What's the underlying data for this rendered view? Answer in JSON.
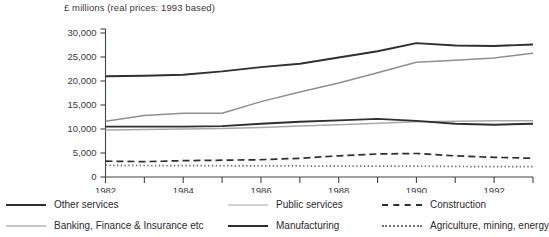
{
  "chart_data": {
    "type": "line",
    "title": "£ millions (real prices: 1993 based)",
    "xlabel": "",
    "ylabel": "",
    "grid": false,
    "legend_position": "bottom",
    "x": [
      1982,
      1983,
      1984,
      1985,
      1986,
      1987,
      1988,
      1989,
      1990,
      1991,
      1992,
      1993
    ],
    "xlim": [
      1982,
      1993
    ],
    "ylim": [
      0,
      30000
    ],
    "ytick_labels": [
      "0",
      "5,000",
      "10,000",
      "15,000",
      "20,000",
      "25,000",
      "30,000"
    ],
    "yticks": [
      0,
      5000,
      10000,
      15000,
      20000,
      25000,
      30000
    ],
    "xtick_labels": [
      "1982",
      "1984",
      "1986",
      "1988",
      "1990",
      "1992"
    ],
    "xticks_labeled": [
      1982,
      1984,
      1986,
      1988,
      1990,
      1992
    ],
    "xticks_all": [
      1982,
      1983,
      1984,
      1985,
      1986,
      1987,
      1988,
      1989,
      1990,
      1991,
      1992,
      1993
    ],
    "series": [
      {
        "name": "Other services",
        "style": "solid-dark",
        "color": "#2f2f2f",
        "values": [
          21000,
          21100,
          21300,
          22000,
          22900,
          23600,
          24900,
          26200,
          27900,
          27400,
          27300,
          27600
        ]
      },
      {
        "name": "Banking, Finance & Insurance etc",
        "style": "solid-mid",
        "color": "#8f8f8f",
        "values": [
          11600,
          12800,
          13300,
          13300,
          15700,
          17700,
          19600,
          21700,
          23900,
          24300,
          24800,
          25800
        ]
      },
      {
        "name": "Public services",
        "style": "solid-light",
        "color": "#a8a8a8",
        "values": [
          9800,
          9900,
          10000,
          10100,
          10300,
          10600,
          10900,
          11200,
          11500,
          11600,
          11700,
          11700
        ]
      },
      {
        "name": "Manufacturing",
        "style": "solid-dark",
        "color": "#2f2f2f",
        "values": [
          10500,
          10500,
          10500,
          10600,
          11100,
          11500,
          11800,
          12100,
          11700,
          11100,
          10900,
          11100
        ]
      },
      {
        "name": "Construction",
        "style": "dashed",
        "color": "#2f2f2f",
        "values": [
          3300,
          3200,
          3400,
          3500,
          3600,
          3900,
          4400,
          4800,
          4900,
          4400,
          4100,
          3900
        ]
      },
      {
        "name": "Agriculture, mining, energy",
        "style": "dotted",
        "color": "#6f6f6f",
        "values": [
          2450,
          2400,
          2350,
          2350,
          2300,
          2300,
          2250,
          2250,
          2250,
          2200,
          2150,
          2150
        ]
      }
    ]
  },
  "legend": {
    "col1": [
      {
        "label": "Other services"
      },
      {
        "label": "Banking, Finance & Insurance etc"
      }
    ],
    "col2": [
      {
        "label": "Public services"
      },
      {
        "label": "Manufacturing"
      }
    ],
    "col3": [
      {
        "label": "Construction"
      },
      {
        "label": "Agriculture, mining, energy"
      }
    ]
  }
}
